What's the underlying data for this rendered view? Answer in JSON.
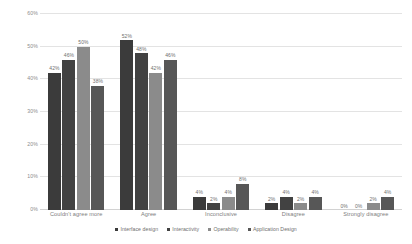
{
  "chart_data": {
    "type": "bar",
    "title": "",
    "xlabel": "",
    "ylabel": "",
    "ylim": [
      0,
      60
    ],
    "ytick_labels": [
      "0%",
      "10%",
      "20%",
      "30%",
      "40%",
      "50%",
      "60%"
    ],
    "ytick_values": [
      0,
      10,
      20,
      30,
      40,
      50,
      60
    ],
    "grid": true,
    "legend_position": "bottom",
    "value_suffix": "%",
    "categories": [
      "Couldn't agree more",
      "Agree",
      "Inconclusive",
      "Disagree",
      "Strongly disagree"
    ],
    "series": [
      {
        "name": "Interface design",
        "color": "#3b3b3b",
        "values": [
          42,
          52,
          4,
          2,
          0
        ],
        "labels": [
          "42%",
          "52%",
          "4%",
          "2%",
          "0%"
        ]
      },
      {
        "name": "Interactivity",
        "color": "#424242",
        "values": [
          46,
          48,
          2,
          4,
          0
        ],
        "labels": [
          "46%",
          "48%",
          "2%",
          "4%",
          "0%"
        ]
      },
      {
        "name": "Operability",
        "color": "#8b8b8b",
        "values": [
          50,
          42,
          4,
          2,
          2
        ],
        "labels": [
          "50%",
          "42%",
          "4%",
          "2%",
          "2%"
        ]
      },
      {
        "name": "Application Design",
        "color": "#575757",
        "values": [
          38,
          46,
          8,
          4,
          4
        ],
        "labels": [
          "38%",
          "46%",
          "8%",
          "4%",
          "4%"
        ]
      }
    ]
  },
  "colors": {
    "background": "#ffffff",
    "gridline": "#e3e3e3",
    "axis_text": "#8d8d8d",
    "label_text": "#6f6f6f"
  }
}
